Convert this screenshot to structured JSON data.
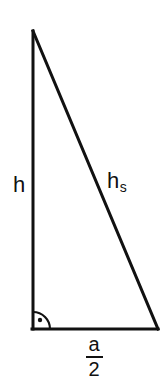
{
  "figure": {
    "kind": "geometry-diagram",
    "shape": "right-triangle",
    "title": "",
    "background_color": "#ffffff",
    "stroke_color": "#111111",
    "stroke_width": 3
  },
  "vertices": {
    "apex": {
      "x": 33,
      "y": 31
    },
    "bottom_left": {
      "x": 33,
      "y": 329
    },
    "bottom_right": {
      "x": 158,
      "y": 329
    }
  },
  "sides": {
    "vertical_leg": {
      "label": "h",
      "from": "apex",
      "to": "bottom_left"
    },
    "base_leg": {
      "label": "a/2",
      "from": "bottom_left",
      "to": "bottom_right"
    },
    "hypotenuse": {
      "label": "hs",
      "from": "apex",
      "to": "bottom_right"
    }
  },
  "labels": {
    "height": "h",
    "slant_base": "h",
    "slant_sub": "s",
    "base_numerator": "a",
    "base_denominator": "2"
  },
  "right_angle_marker": {
    "name": "right-angle-arc",
    "at_vertex": "bottom_left",
    "radius": 17,
    "dot_x": 40,
    "dot_y": 320,
    "dot_radius": 2.2
  }
}
